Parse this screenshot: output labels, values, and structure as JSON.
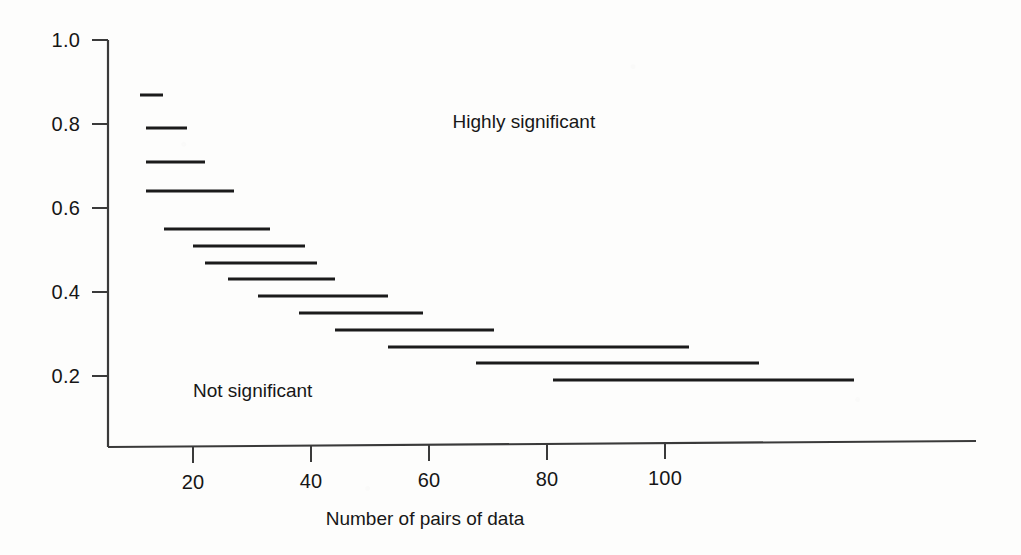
{
  "chart_data": {
    "type": "line",
    "title": "",
    "subtitle": "",
    "xlabel": "Number of pairs of data",
    "ylabel": "",
    "xlim": [
      10,
      132
    ],
    "ylim": [
      0.1,
      1.04
    ],
    "grid": false,
    "legend_position": "none",
    "xticks": [
      20,
      40,
      60,
      80,
      100
    ],
    "xtick_labels": [
      "20",
      "40",
      "60",
      "80",
      "100"
    ],
    "yticks": [
      0.2,
      0.4,
      0.6,
      0.8,
      1.0
    ],
    "ytick_labels": [
      "0.2",
      "0.4",
      "0.6",
      "0.8",
      "1.0"
    ],
    "series_name": "Critical value of correlation coefficient",
    "segments": [
      {
        "label": "step-1",
        "x_start": 11,
        "x_end": 15,
        "y": 0.87
      },
      {
        "label": "step-2",
        "x_start": 12,
        "x_end": 19,
        "y": 0.79
      },
      {
        "label": "step-3",
        "x_start": 12,
        "x_end": 22,
        "y": 0.71
      },
      {
        "label": "step-4",
        "x_start": 12,
        "x_end": 27,
        "y": 0.64
      },
      {
        "label": "step-5",
        "x_start": 15,
        "x_end": 33,
        "y": 0.55
      },
      {
        "label": "step-6",
        "x_start": 20,
        "x_end": 39,
        "y": 0.51
      },
      {
        "label": "step-7",
        "x_start": 22,
        "x_end": 41,
        "y": 0.47
      },
      {
        "label": "step-8",
        "x_start": 26,
        "x_end": 44,
        "y": 0.43
      },
      {
        "label": "step-9",
        "x_start": 31,
        "x_end": 53,
        "y": 0.39
      },
      {
        "label": "step-10",
        "x_start": 38,
        "x_end": 59,
        "y": 0.35
      },
      {
        "label": "step-11",
        "x_start": 44,
        "x_end": 71,
        "y": 0.31
      },
      {
        "label": "step-12",
        "x_start": 53,
        "x_end": 104,
        "y": 0.27
      },
      {
        "label": "step-13",
        "x_start": 68,
        "x_end": 116,
        "y": 0.23
      },
      {
        "label": "step-14",
        "x_start": 81,
        "x_end": 132,
        "y": 0.19
      }
    ],
    "annotations": [
      {
        "name": "highly-significant",
        "text": "Highly significant",
        "x": 64,
        "y": 0.8
      },
      {
        "name": "not-significant",
        "text": "Not significant",
        "x": 20,
        "y": 0.16
      }
    ]
  },
  "axis": {
    "x_title": "Number of pairs of data",
    "y_title": ""
  },
  "colors": {
    "ink": "#1b1b1b",
    "axis": "#3a3a3a",
    "paper": "#fdfdfc"
  }
}
